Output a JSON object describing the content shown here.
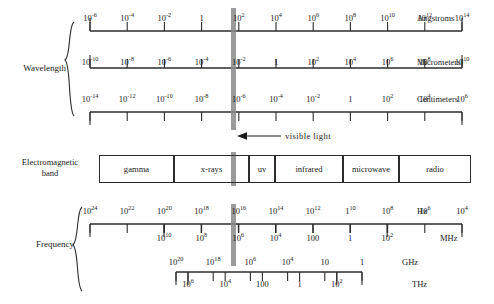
{
  "figure": {
    "type": "electromagnetic-spectrum-diagram",
    "group_labels": {
      "wavelength": "Wavelength",
      "frequency": "Frequency",
      "band": "Electromagnetic\nband",
      "band_line1": "Electromagnetic",
      "band_line2": "band"
    },
    "visible_light_annotation": "visible  light"
  },
  "chart_data": {
    "type": "table",
    "annotations": [
      "visible  light"
    ],
    "axes": [
      {
        "name": "angstroms",
        "unit": "Angstroms",
        "group": "Wavelength",
        "direction": "increasing-right",
        "ticks": [
          "10^-6",
          "10^-4",
          "10^-2",
          "1",
          "10^2",
          "10^4",
          "10^6",
          "10^8",
          "10^10",
          "10^12",
          "10^14"
        ],
        "tick_labels": [
          {
            "mantissa": "10",
            "exp": "-6"
          },
          {
            "mantissa": "10",
            "exp": "-4"
          },
          {
            "mantissa": "10",
            "exp": "-2"
          },
          {
            "mantissa": "1",
            "exp": ""
          },
          {
            "mantissa": "10",
            "exp": "2"
          },
          {
            "mantissa": "10",
            "exp": "4"
          },
          {
            "mantissa": "10",
            "exp": "6"
          },
          {
            "mantissa": "10",
            "exp": "8"
          },
          {
            "mantissa": "10",
            "exp": "10"
          },
          {
            "mantissa": "10",
            "exp": "12"
          },
          {
            "mantissa": "10",
            "exp": "14"
          }
        ]
      },
      {
        "name": "micrometers",
        "unit": "Micrometers",
        "group": "Wavelength",
        "direction": "increasing-right",
        "ticks": [
          "10^-10",
          "10^-8",
          "10^-6",
          "10^-4",
          "10^-2",
          "1",
          "10^2",
          "10^4",
          "10^6",
          "10^8",
          "10^10"
        ],
        "tick_labels": [
          {
            "mantissa": "10",
            "exp": "-10"
          },
          {
            "mantissa": "10",
            "exp": "-8"
          },
          {
            "mantissa": "10",
            "exp": "-6"
          },
          {
            "mantissa": "10",
            "exp": "-4"
          },
          {
            "mantissa": "10",
            "exp": "-2"
          },
          {
            "mantissa": "1",
            "exp": ""
          },
          {
            "mantissa": "10",
            "exp": "2"
          },
          {
            "mantissa": "10",
            "exp": "4"
          },
          {
            "mantissa": "10",
            "exp": "6"
          },
          {
            "mantissa": "10",
            "exp": "8"
          },
          {
            "mantissa": "10",
            "exp": "10"
          }
        ]
      },
      {
        "name": "centimeters",
        "unit": "Centimeters",
        "group": "Wavelength",
        "direction": "increasing-right",
        "ticks": [
          "10^-14",
          "10^-12",
          "10^-10",
          "10^-8",
          "10^-6",
          "10^-4",
          "10^-2",
          "1",
          "10^2",
          "10^4",
          "10^6"
        ],
        "tick_labels": [
          {
            "mantissa": "10",
            "exp": "-14"
          },
          {
            "mantissa": "10",
            "exp": "-12"
          },
          {
            "mantissa": "10",
            "exp": "-10"
          },
          {
            "mantissa": "10",
            "exp": "-8"
          },
          {
            "mantissa": "10",
            "exp": "-6"
          },
          {
            "mantissa": "10",
            "exp": "-4"
          },
          {
            "mantissa": "10",
            "exp": "-2"
          },
          {
            "mantissa": "1",
            "exp": ""
          },
          {
            "mantissa": "10",
            "exp": "2"
          },
          {
            "mantissa": "10",
            "exp": "4"
          },
          {
            "mantissa": "10",
            "exp": "6"
          }
        ]
      },
      {
        "name": "hz",
        "unit": "Hz",
        "group": "Frequency",
        "direction": "decreasing-right",
        "ticks": [
          "10^24",
          "10^22",
          "10^20",
          "10^18",
          "10^16",
          "10^14",
          "10^12",
          "1^10",
          "10^8",
          "10^6",
          "10^4"
        ],
        "tick_labels": [
          {
            "mantissa": "10",
            "exp": "24"
          },
          {
            "mantissa": "10",
            "exp": "22"
          },
          {
            "mantissa": "10",
            "exp": "20"
          },
          {
            "mantissa": "10",
            "exp": "18"
          },
          {
            "mantissa": "10",
            "exp": "16"
          },
          {
            "mantissa": "10",
            "exp": "14"
          },
          {
            "mantissa": "10",
            "exp": "12"
          },
          {
            "mantissa": "1",
            "exp": "10"
          },
          {
            "mantissa": "10",
            "exp": "8"
          },
          {
            "mantissa": "10",
            "exp": "6"
          },
          {
            "mantissa": "10",
            "exp": "4"
          }
        ]
      },
      {
        "name": "mhz",
        "unit": "MHz",
        "group": "Frequency",
        "direction": "decreasing-right",
        "ticks": [
          "10^10",
          "10^8",
          "10^6",
          "10^4",
          "100",
          "1",
          "10^-2"
        ],
        "tick_labels": [
          {
            "mantissa": "10",
            "exp": "10"
          },
          {
            "mantissa": "10",
            "exp": "8"
          },
          {
            "mantissa": "10",
            "exp": "6"
          },
          {
            "mantissa": "10",
            "exp": "4"
          },
          {
            "mantissa": "100",
            "exp": ""
          },
          {
            "mantissa": "1",
            "exp": ""
          },
          {
            "mantissa": "10",
            "exp": "2"
          }
        ]
      },
      {
        "name": "ghz",
        "unit": "GHz",
        "group": "Frequency",
        "direction": "decreasing-right",
        "ticks": [
          "10^20",
          "10^18",
          "10^6",
          "10^4",
          "10",
          "1"
        ],
        "tick_labels": [
          {
            "mantissa": "10",
            "exp": "20"
          },
          {
            "mantissa": "10",
            "exp": "18"
          },
          {
            "mantissa": "10",
            "exp": "6"
          },
          {
            "mantissa": "10",
            "exp": "4"
          },
          {
            "mantissa": "10",
            "exp": ""
          },
          {
            "mantissa": "1",
            "exp": ""
          }
        ]
      },
      {
        "name": "thz",
        "unit": "THz",
        "group": "Frequency",
        "direction": "decreasing-right",
        "ticks": [
          "10^6",
          "10^4",
          "100",
          "1",
          "10^-2"
        ],
        "tick_labels": [
          {
            "mantissa": "10",
            "exp": "6"
          },
          {
            "mantissa": "10",
            "exp": "4"
          },
          {
            "mantissa": "100",
            "exp": ""
          },
          {
            "mantissa": "1",
            "exp": ""
          },
          {
            "mantissa": "10",
            "exp": "2"
          }
        ]
      }
    ],
    "bands": [
      {
        "label": "gamma",
        "x": 99,
        "width": 75
      },
      {
        "label": "x-rays",
        "x": 174,
        "width": 75
      },
      {
        "label": "uv",
        "x": 249,
        "width": 26
      },
      {
        "label": "infrared",
        "x": 275,
        "width": 68
      },
      {
        "label": "microwave",
        "x": 343,
        "width": 56
      },
      {
        "label": "radio",
        "x": 399,
        "width": 72
      }
    ]
  }
}
